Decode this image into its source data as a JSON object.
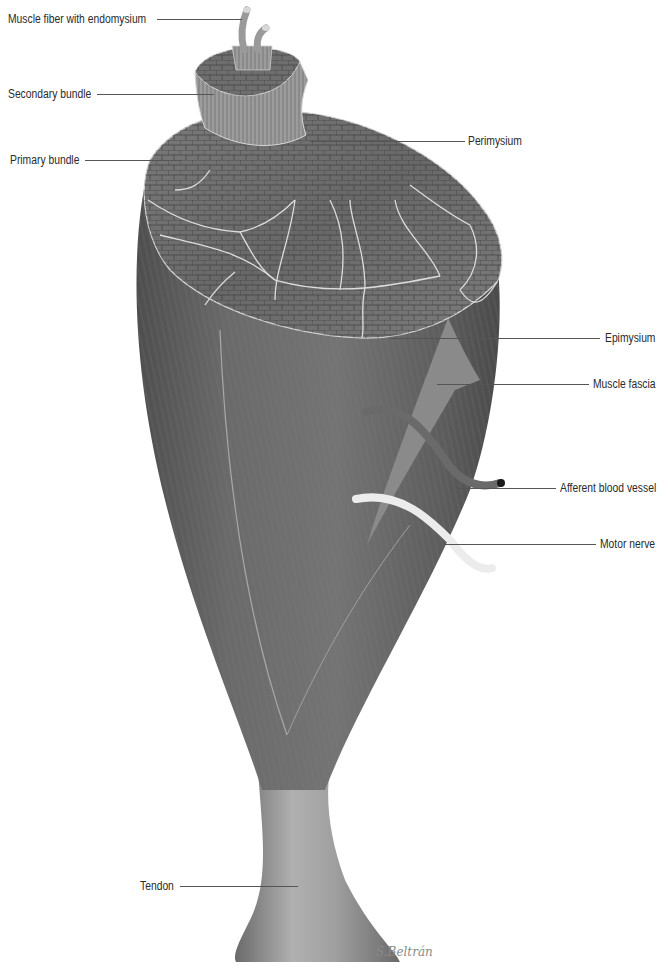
{
  "figure": {
    "colors": {
      "muscle_dark": "#5a5a5a",
      "muscle_mid": "#6e6e6e",
      "muscle_light": "#8c8c8c",
      "perimysium_line": "#d8d8d8",
      "fascia": "#8a8a8a",
      "blood_vessel": "#6a6a6a",
      "motor_nerve": "#eeeeee",
      "tendon": "#9a9a9a",
      "leader_line": "#555555",
      "label_text": "#2a2a2a"
    }
  },
  "labels": {
    "muscle_fiber": "Muscle fiber with endomysium",
    "secondary_bundle": "Secondary bundle",
    "primary_bundle": "Primary bundle",
    "perimysium": "Perimysium",
    "epimysium": "Epimysium",
    "muscle_fascia": "Muscle fascia",
    "afferent_blood_vessel": "Afferent blood vessel",
    "motor_nerve": "Motor nerve",
    "tendon": "Tendon"
  },
  "signature": "S.Beltrán"
}
